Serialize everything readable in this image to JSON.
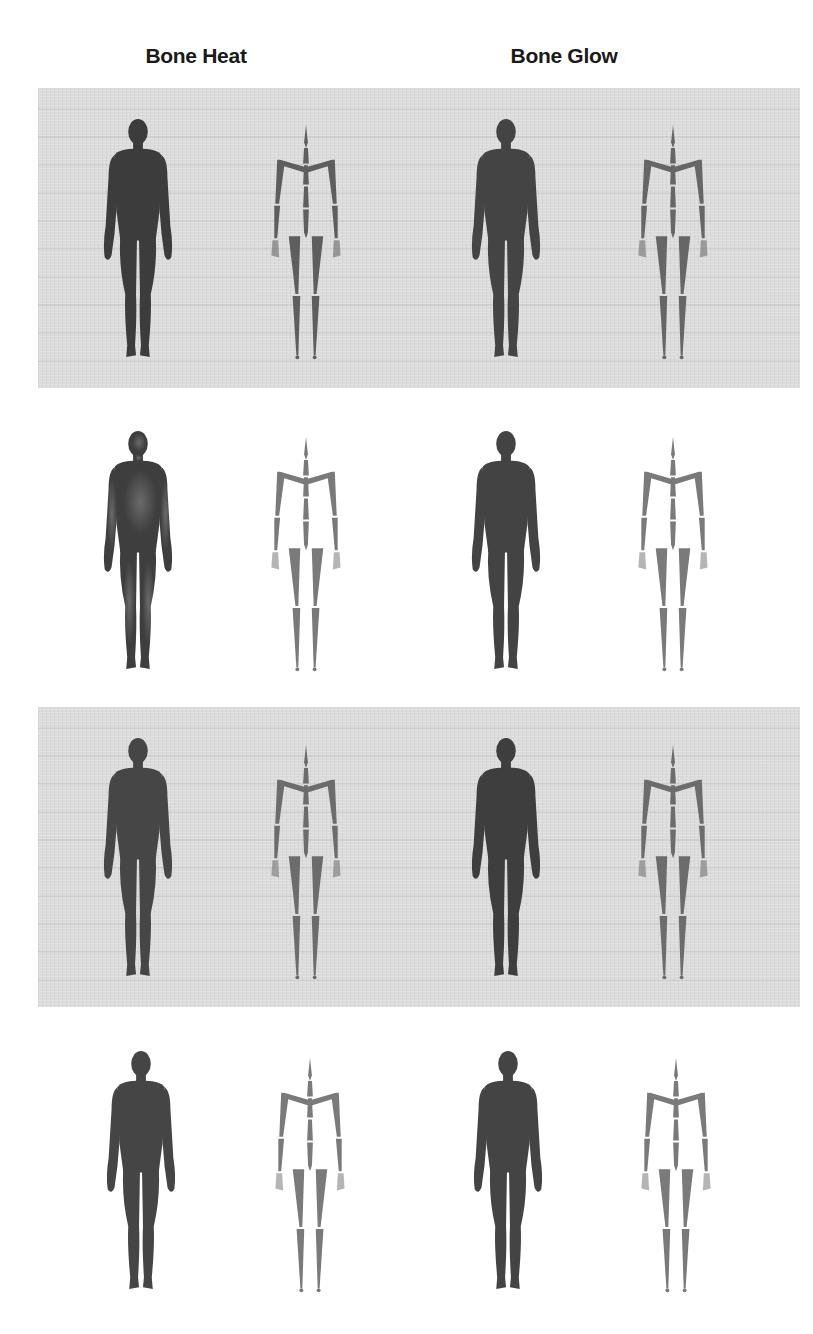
{
  "figure": {
    "column_headers": [
      "Bone Heat",
      "Bone Glow"
    ],
    "rows": [
      {
        "index": 1,
        "shaded": true,
        "panels": [
          {
            "column": "Bone Heat",
            "items": [
              "body-silhouette",
              "skeleton-rig"
            ]
          },
          {
            "column": "Bone Glow",
            "items": [
              "body-silhouette",
              "skeleton-rig"
            ]
          }
        ]
      },
      {
        "index": 2,
        "shaded": false,
        "panels": [
          {
            "column": "Bone Heat",
            "items": [
              "body-silhouette",
              "skeleton-rig"
            ]
          },
          {
            "column": "Bone Glow",
            "items": [
              "body-silhouette",
              "skeleton-rig"
            ]
          }
        ]
      },
      {
        "index": 3,
        "shaded": true,
        "panels": [
          {
            "column": "Bone Heat",
            "items": [
              "body-silhouette",
              "skeleton-rig"
            ]
          },
          {
            "column": "Bone Glow",
            "items": [
              "body-silhouette",
              "skeleton-rig"
            ]
          }
        ]
      },
      {
        "index": 4,
        "shaded": false,
        "panels": [
          {
            "column": "Bone Heat",
            "items": [
              "body-silhouette",
              "skeleton-rig"
            ]
          },
          {
            "column": "Bone Glow",
            "items": [
              "body-silhouette",
              "skeleton-rig"
            ]
          }
        ]
      }
    ],
    "colors": {
      "body": "#3e3e3e",
      "skeleton": "#6e6e6e",
      "shaded_panel": "#dcdcdc",
      "background": "#ffffff",
      "header_text": "#1a1a1a"
    }
  }
}
